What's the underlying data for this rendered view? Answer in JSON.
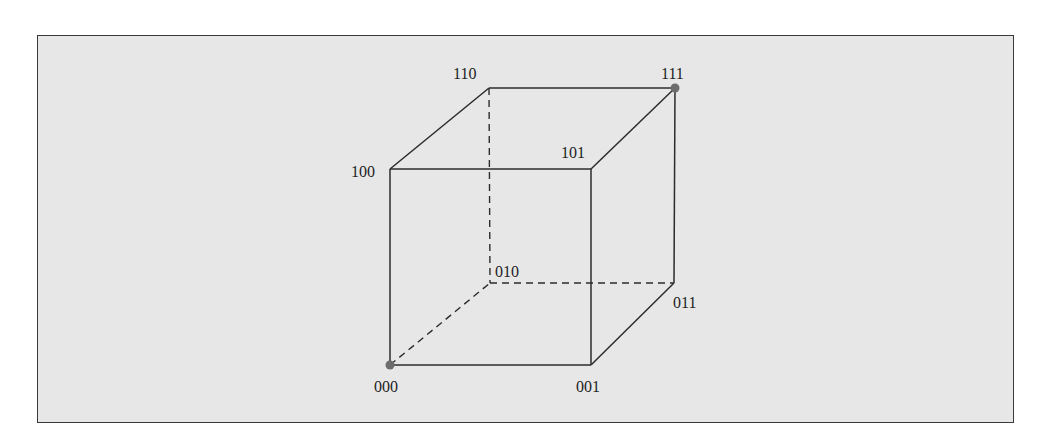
{
  "figure": {
    "type": "3-cube (binary hypercube)",
    "background_color": "#e7e7e7",
    "edge_color": "#2c2c2c",
    "highlight_color": "#6d6d6d",
    "vertices": [
      {
        "id": "000",
        "label": "000",
        "x": 390,
        "y": 365,
        "highlighted": true
      },
      {
        "id": "001",
        "label": "001",
        "x": 591,
        "y": 365,
        "highlighted": false
      },
      {
        "id": "010",
        "label": "010",
        "x": 490,
        "y": 283,
        "highlighted": false
      },
      {
        "id": "011",
        "label": "011",
        "x": 674,
        "y": 283,
        "highlighted": false
      },
      {
        "id": "100",
        "label": "100",
        "x": 390,
        "y": 169,
        "highlighted": false
      },
      {
        "id": "101",
        "label": "101",
        "x": 591,
        "y": 169,
        "highlighted": false
      },
      {
        "id": "110",
        "label": "110",
        "x": 489,
        "y": 88,
        "highlighted": false
      },
      {
        "id": "111",
        "label": "111",
        "x": 675,
        "y": 88,
        "highlighted": true
      }
    ],
    "edges": [
      {
        "from": "000",
        "to": "001",
        "style": "solid"
      },
      {
        "from": "000",
        "to": "100",
        "style": "solid"
      },
      {
        "from": "000",
        "to": "010",
        "style": "dashed"
      },
      {
        "from": "001",
        "to": "101",
        "style": "solid"
      },
      {
        "from": "001",
        "to": "011",
        "style": "solid"
      },
      {
        "from": "100",
        "to": "101",
        "style": "solid"
      },
      {
        "from": "100",
        "to": "110",
        "style": "solid"
      },
      {
        "from": "101",
        "to": "111",
        "style": "solid"
      },
      {
        "from": "110",
        "to": "111",
        "style": "solid"
      },
      {
        "from": "110",
        "to": "010",
        "style": "dashed"
      },
      {
        "from": "010",
        "to": "011",
        "style": "dashed"
      },
      {
        "from": "011",
        "to": "111",
        "style": "solid"
      }
    ]
  },
  "labels": {
    "v000": "000",
    "v001": "001",
    "v010": "010",
    "v011": "011",
    "v100": "100",
    "v101": "101",
    "v110": "110",
    "v111": "111"
  }
}
